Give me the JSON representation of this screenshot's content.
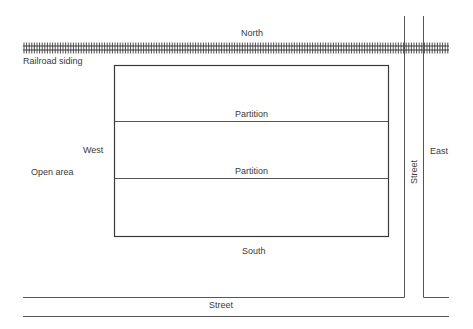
{
  "diagram": {
    "type": "site-plan",
    "labels": {
      "north": "North",
      "south": "South",
      "west": "West",
      "east": "East",
      "railroad": "Railroad siding",
      "open_area": "Open area",
      "partition_1": "Partition",
      "partition_2": "Partition",
      "street_bottom": "Street",
      "street_right": "Street"
    },
    "colors": {
      "line": "#3a3a3a",
      "background": "#ffffff"
    }
  }
}
